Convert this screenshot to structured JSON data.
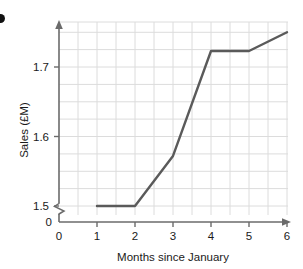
{
  "chart_data": {
    "type": "line",
    "title": "",
    "xlabel": "Months since January",
    "ylabel": "Sales (£M)",
    "x": [
      1,
      2,
      3,
      4,
      5,
      6
    ],
    "values": [
      1.5,
      1.5,
      1.572,
      1.723,
      1.723,
      1.75
    ],
    "series": [
      {
        "name": "Sales",
        "x": [
          1,
          2,
          3,
          4,
          5,
          6
        ],
        "values": [
          1.5,
          1.5,
          1.572,
          1.723,
          1.723,
          1.75
        ],
        "color": "#5a5a5a"
      }
    ],
    "xlim": [
      0,
      6.4
    ],
    "ylim": [
      1.5,
      1.775
    ],
    "x_ticks": [
      "0",
      "1",
      "2",
      "3",
      "4",
      "5",
      "6"
    ],
    "x_tick_values": [
      0,
      1,
      2,
      3,
      4,
      5,
      6
    ],
    "y_ticks": [
      "0",
      "1.5",
      "1.6",
      "1.7"
    ],
    "y_tick_values": [
      0,
      1.5,
      1.6,
      1.7
    ],
    "y_axis_break": true,
    "grid": true,
    "grid_color": "#d8d8d8",
    "grid_x_step": 0.5,
    "grid_y_step": 0.025,
    "legend": "none",
    "axis_arrows": true,
    "line_color": "#5a5a5a",
    "axis_color": "#6b6b6b"
  },
  "labels": {
    "y_axis_title": "Sales (£M)",
    "x_axis_title": "Months since January",
    "y_tick_0": "0",
    "y_tick_15": "1.5",
    "y_tick_16": "1.6",
    "y_tick_17": "1.7",
    "x_tick_0": "0",
    "x_tick_1": "1",
    "x_tick_2": "2",
    "x_tick_3": "3",
    "x_tick_4": "4",
    "x_tick_5": "5",
    "x_tick_6": "6"
  }
}
